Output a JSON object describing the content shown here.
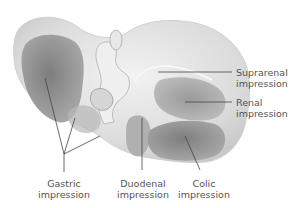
{
  "figure": {
    "labels": {
      "suprarenal": {
        "line1": "Suprarenal",
        "line2": "impression"
      },
      "renal": {
        "line1": "Renal",
        "line2": "impression"
      },
      "gastric": {
        "line1": "Gastric",
        "line2": "impression"
      },
      "duodenal": {
        "line1": "Duodenal",
        "line2": "impression"
      },
      "colic": {
        "line1": "Colic",
        "line2": "impression"
      }
    },
    "colors": {
      "organ_light": "#e6e6e6",
      "organ_mid": "#c4c4c4",
      "impression_dark": "#8f8f8f",
      "leader_line": "#444444",
      "text": "#555555"
    }
  }
}
